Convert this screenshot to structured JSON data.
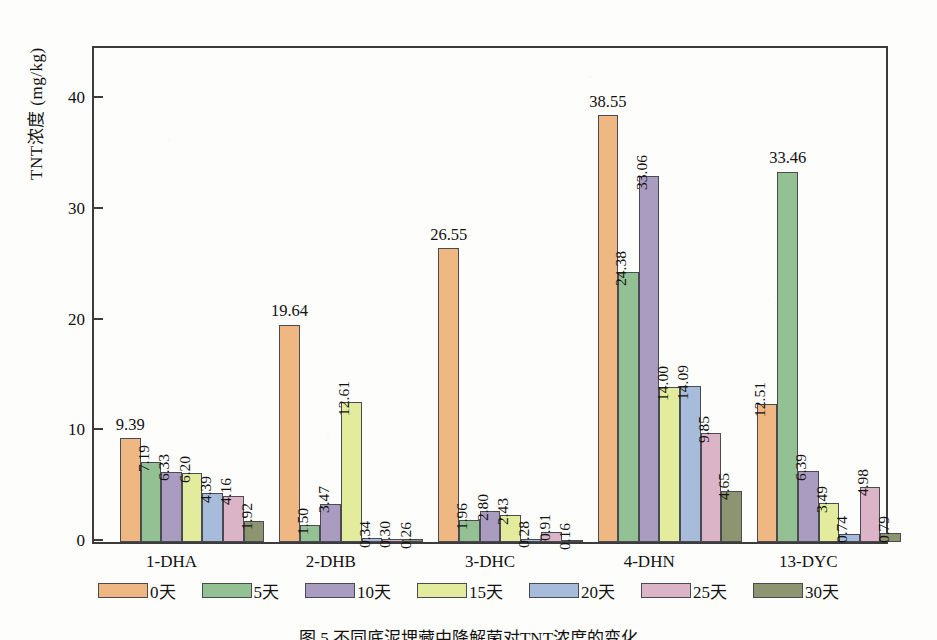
{
  "chart_data": {
    "type": "bar",
    "title": "",
    "xlabel": "",
    "ylabel": "TNT浓度 (mg/kg)",
    "ylim": [
      0,
      45
    ],
    "yticks": [
      0,
      10,
      20,
      30,
      40
    ],
    "grid": false,
    "legend_position": "bottom",
    "categories": [
      "1-DHA",
      "2-DHB",
      "3-DHC",
      "4-DHN",
      "13-DYC"
    ],
    "series": [
      {
        "name": "0天",
        "color": "#EFB782",
        "values": [
          9.39,
          19.64,
          26.55,
          38.55,
          12.51
        ]
      },
      {
        "name": "5天",
        "color": "#93C193",
        "values": [
          7.19,
          1.5,
          1.96,
          24.38,
          33.46
        ]
      },
      {
        "name": "10天",
        "color": "#A99CC0",
        "values": [
          6.33,
          3.47,
          2.8,
          33.06,
          6.39
        ]
      },
      {
        "name": "15天",
        "color": "#E2EC9C",
        "values": [
          6.2,
          12.61,
          2.43,
          14.0,
          3.49
        ]
      },
      {
        "name": "20天",
        "color": "#A7BCDB",
        "values": [
          4.39,
          0.34,
          0.28,
          14.09,
          0.74
        ]
      },
      {
        "name": "25天",
        "color": "#DCB4C7",
        "values": [
          4.16,
          0.3,
          0.91,
          9.85,
          4.98
        ]
      },
      {
        "name": "30天",
        "color": "#8C9470",
        "values": [
          1.92,
          0.26,
          0.16,
          4.65,
          0.79
        ]
      }
    ],
    "value_labels": {
      "1-DHA": [
        "9.39",
        "7.19",
        "6.33",
        "6.20",
        "4.39",
        "4.16",
        "1.92"
      ],
      "2-DHB": [
        "19.64",
        "1.50",
        "3.47",
        "12.61",
        "0.34",
        "0.30",
        "0.26"
      ],
      "3-DHC": [
        "26.55",
        "1.96",
        "2.80",
        "2.43",
        "0.28",
        "0.91",
        "0.16"
      ],
      "4-DHN": [
        "38.55",
        "24.38",
        "33.06",
        "14.00",
        "14.09",
        "9.85",
        "4.65"
      ],
      "13-DYC": [
        "12.51",
        "33.46",
        "6.39",
        "3.49",
        "0.74",
        "4.98",
        "0.79"
      ]
    }
  },
  "axis": {
    "y_title": "TNT浓度 (mg/kg)",
    "y_tick_labels": [
      "0",
      "10",
      "20",
      "30",
      "40"
    ]
  },
  "legend": {
    "items": [
      {
        "label": "0天"
      },
      {
        "label": "5天"
      },
      {
        "label": "10天"
      },
      {
        "label": "15天"
      },
      {
        "label": "20天"
      },
      {
        "label": "25天"
      },
      {
        "label": "30天"
      }
    ]
  },
  "caption": {
    "text": "图 5  不同底泥埋藏中降解菌对TNT浓度的变化"
  }
}
